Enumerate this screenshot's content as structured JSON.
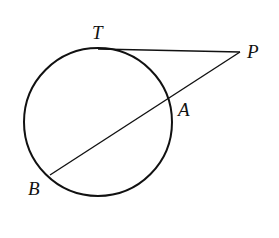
{
  "diagram": {
    "type": "circle-tangent-secant",
    "circle": {
      "cx": 98,
      "cy": 122,
      "r": 74
    },
    "points": {
      "T": {
        "label": "T",
        "x": 98,
        "y": 49,
        "label_x": 92,
        "label_y": 39
      },
      "P": {
        "label": "P",
        "x": 240,
        "y": 52,
        "label_x": 247,
        "label_y": 58
      },
      "A": {
        "label": "A",
        "x": 168,
        "y": 99,
        "label_x": 178,
        "label_y": 116
      },
      "B": {
        "label": "B",
        "x": 50,
        "y": 175,
        "label_x": 28,
        "label_y": 195
      }
    },
    "segments": [
      {
        "name": "tangent-TP",
        "from": "T",
        "to": "P"
      },
      {
        "name": "secant-PB",
        "from": "P",
        "to": "B"
      }
    ],
    "stroke_color": "#111111"
  }
}
